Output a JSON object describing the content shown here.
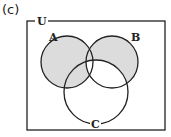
{
  "panel_label": "(c)",
  "diagram": {
    "type": "venn",
    "universe_label": "U",
    "sets": [
      {
        "name": "A",
        "label": "A"
      },
      {
        "name": "B",
        "label": "B"
      },
      {
        "name": "C",
        "label": "C"
      }
    ],
    "shaded_regions": [
      "A only",
      "B only",
      "A∩B not C",
      "A∩C not B"
    ],
    "unshaded_regions": [
      "A∩B∩C",
      "B∩C not A",
      "C only",
      "outside"
    ],
    "colors": {
      "shade": "#dcdcdc",
      "stroke": "#222222",
      "background": "#ffffff"
    }
  }
}
